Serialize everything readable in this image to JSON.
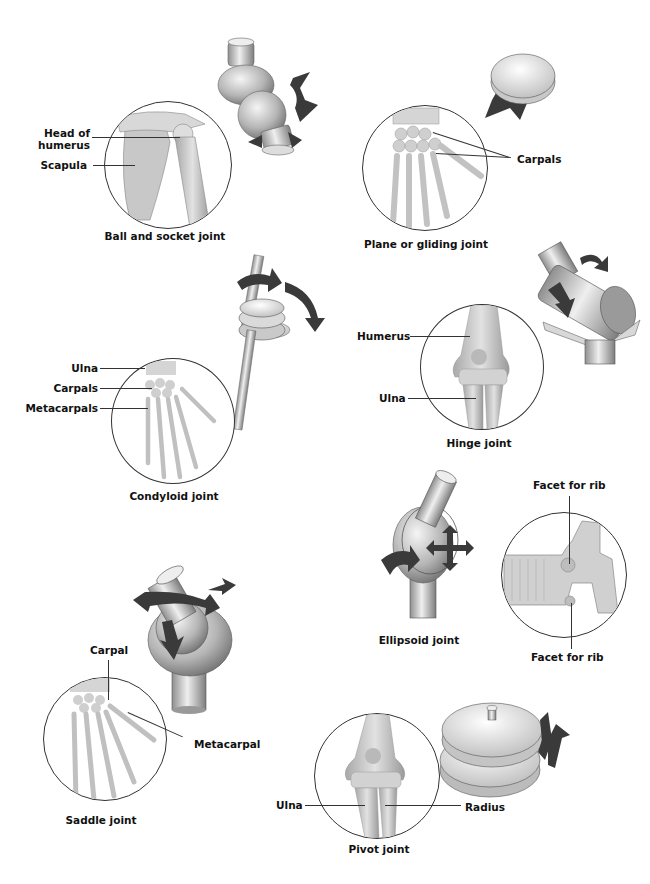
{
  "joints": {
    "ball_socket": {
      "caption": "Ball and socket joint",
      "labels": [
        "Head of",
        "humerus",
        "Scapula"
      ]
    },
    "plane": {
      "caption": "Plane or gliding joint",
      "labels": [
        "Carpals"
      ]
    },
    "condyloid": {
      "caption": "Condyloid joint",
      "labels": [
        "Ulna",
        "Carpals",
        "Metacarpals"
      ]
    },
    "hinge": {
      "caption": "Hinge joint",
      "labels": [
        "Humerus",
        "Ulna"
      ]
    },
    "ellipsoid": {
      "caption": "Ellipsoid joint",
      "labels": [
        "Facet for rib",
        "Facet for rib"
      ]
    },
    "saddle": {
      "caption": "Saddle joint",
      "labels": [
        "Carpal",
        "Metacarpal"
      ]
    },
    "pivot": {
      "caption": "Pivot joint",
      "labels": [
        "Ulna",
        "Radius"
      ]
    }
  },
  "colors": {
    "arrow": "#3a3a3a",
    "model_light": "#e8e8e8",
    "model_dark": "#8a8a8a",
    "bone": "#cfcfcf",
    "outline": "#333333"
  }
}
